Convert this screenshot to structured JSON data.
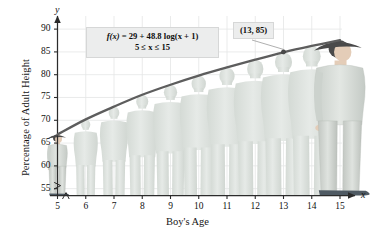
{
  "figure": {
    "title": "",
    "axis_vars": {
      "x": "x",
      "y": "y"
    }
  },
  "chart_data": {
    "type": "line",
    "title": "",
    "xlabel": "Boy's Age",
    "ylabel": "Percentage of Adult Height",
    "formula": "f(x) = 29 + 48.8 log(x + 1)",
    "formula_parts": {
      "fx": "f",
      "fx_arg": "(x)",
      "equals": "=",
      "constant": "29",
      "plus": "+",
      "coefficient": "48.8",
      "log": "log(x + 1)"
    },
    "domain_text": "5 ≤ x ≤ 15",
    "xlim": [
      5,
      15
    ],
    "ylim": [
      53.5,
      92
    ],
    "xticks": [
      5,
      6,
      7,
      8,
      9,
      10,
      11,
      12,
      13,
      14,
      15
    ],
    "yticks": [
      55,
      60,
      65,
      70,
      75,
      80,
      85,
      90
    ],
    "grid": true,
    "legend": "none",
    "axis_breaks": {
      "x": true,
      "y": true
    },
    "x": [
      5,
      6,
      7,
      8,
      9,
      10,
      11,
      12,
      13,
      14,
      15
    ],
    "values": [
      66.9,
      70.2,
      73.0,
      75.6,
      77.8,
      79.8,
      81.6,
      83.3,
      84.9,
      86.3,
      87.6
    ],
    "annotations": [
      {
        "label": "(13, 85)",
        "x": 13,
        "y": 85,
        "marker": true
      }
    ],
    "series": [
      {
        "name": "Percentage of Adult Height",
        "color": "#5d5d5d",
        "values": [
          66.9,
          70.2,
          73.0,
          75.6,
          77.8,
          79.8,
          81.6,
          83.3,
          84.9,
          86.3,
          87.6
        ]
      }
    ],
    "figures": [
      {
        "age": 5,
        "style": "detailed-child"
      },
      {
        "age": 6,
        "style": "silhouette"
      },
      {
        "age": 7,
        "style": "silhouette"
      },
      {
        "age": 8,
        "style": "silhouette"
      },
      {
        "age": 9,
        "style": "silhouette"
      },
      {
        "age": 10,
        "style": "silhouette"
      },
      {
        "age": 11,
        "style": "silhouette"
      },
      {
        "age": 12,
        "style": "silhouette"
      },
      {
        "age": 13,
        "style": "silhouette"
      },
      {
        "age": 14,
        "style": "silhouette"
      },
      {
        "age": 15,
        "style": "detailed-teen"
      }
    ]
  },
  "colors": {
    "curve": "#5d5d5d",
    "axis": "#2b2b2b",
    "grid": "#e2e4e4",
    "card_bg": "#eceded",
    "card_border": "#d6d7d7",
    "silhouette": "#dfe3e0",
    "skin": "#e4cdb8",
    "shirt": "#d7dbd6",
    "pants": "#cfd3cf",
    "hair": "#4a4a4a",
    "shoes": "#4f5a63"
  }
}
